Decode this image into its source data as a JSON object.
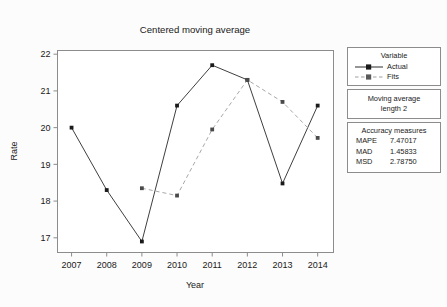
{
  "chart_data": {
    "type": "line",
    "title": "Centered moving average",
    "xlabel": "Year",
    "ylabel": "Rate",
    "x": [
      2007,
      2008,
      2009,
      2010,
      2011,
      2012,
      2013,
      2014
    ],
    "xtick_labels": [
      "2007",
      "2008",
      "2009",
      "2010",
      "2011",
      "2012",
      "2013",
      "2014"
    ],
    "ytick_labels": [
      "17",
      "18",
      "19",
      "20",
      "21",
      "22"
    ],
    "yticks": [
      17,
      18,
      19,
      20,
      21,
      22
    ],
    "ylim": [
      16.6,
      22.1
    ],
    "xlim": [
      2006.6,
      2014.45
    ],
    "grid": false,
    "legend_position": "right",
    "series": [
      {
        "name": "Actual",
        "style": "solid",
        "color": "#3f3f3f",
        "marker": "square",
        "values": [
          20.0,
          18.3,
          16.9,
          20.6,
          21.7,
          21.3,
          18.48,
          20.6
        ]
      },
      {
        "name": "Fits",
        "style": "dashed",
        "color": "#a8a8a8",
        "marker": "square",
        "values": [
          null,
          null,
          18.35,
          18.15,
          19.95,
          21.3,
          20.7,
          19.72
        ]
      }
    ]
  },
  "legend": {
    "variable_title": "Variable",
    "entries": [
      {
        "label": "Actual"
      },
      {
        "label": "Fits"
      }
    ]
  },
  "moving_average_box": {
    "line1": "Moving average",
    "line2": "length 2"
  },
  "accuracy": {
    "title": "Accuracy measures",
    "rows": [
      {
        "key": "MAPE",
        "value": "7.47017"
      },
      {
        "key": "MAD",
        "value": "1.45833"
      },
      {
        "key": "MSD",
        "value": "2.78750"
      }
    ]
  }
}
